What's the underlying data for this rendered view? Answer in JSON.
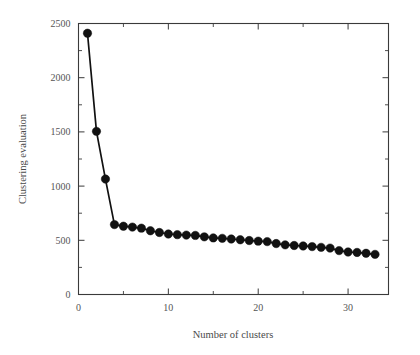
{
  "chart_data": {
    "type": "line",
    "title": "",
    "subtitle": "",
    "xlabel": "Number of clusters",
    "ylabel": "Clustering evaluation",
    "xlim": [
      0,
      34.5
    ],
    "ylim": [
      0,
      2500
    ],
    "grid": false,
    "legend": null,
    "legend_position": "none",
    "marker": "filled-circle",
    "marker_color": "#111111",
    "line_color": "#111111",
    "x_ticks_major": [
      0,
      10,
      20,
      30
    ],
    "x_ticks_major_labels": [
      "0",
      "10",
      "20",
      "30"
    ],
    "x_ticks_minor": [
      5,
      15,
      25
    ],
    "y_ticks_major": [
      0,
      500,
      1000,
      1500,
      2000,
      2500
    ],
    "y_ticks_major_labels": [
      "0",
      "500",
      "1000",
      "1500",
      "2000",
      "2500"
    ],
    "y_ticks_minor": [
      250,
      750,
      1250,
      1750,
      2250
    ],
    "x": [
      1,
      2,
      3,
      4,
      5,
      6,
      7,
      8,
      9,
      10,
      11,
      12,
      13,
      14,
      15,
      16,
      17,
      18,
      19,
      20,
      21,
      22,
      23,
      24,
      25,
      26,
      27,
      28,
      29,
      30,
      31,
      32,
      33
    ],
    "values": [
      2410,
      1505,
      1065,
      645,
      630,
      622,
      612,
      588,
      572,
      558,
      552,
      548,
      545,
      532,
      522,
      518,
      512,
      505,
      498,
      492,
      488,
      470,
      458,
      452,
      448,
      442,
      435,
      428,
      405,
      392,
      388,
      380,
      370
    ],
    "series": [
      {
        "name": "Clustering evaluation",
        "values": [
          2410,
          1505,
          1065,
          645,
          630,
          622,
          612,
          588,
          572,
          558,
          552,
          548,
          545,
          532,
          522,
          518,
          512,
          505,
          498,
          492,
          488,
          470,
          458,
          452,
          448,
          442,
          435,
          428,
          405,
          392,
          388,
          380,
          370
        ]
      }
    ],
    "annotations": []
  },
  "figure": {
    "background_color": "#ffffff",
    "frame_color": "#3a3a3a",
    "text_color": "#555555"
  }
}
